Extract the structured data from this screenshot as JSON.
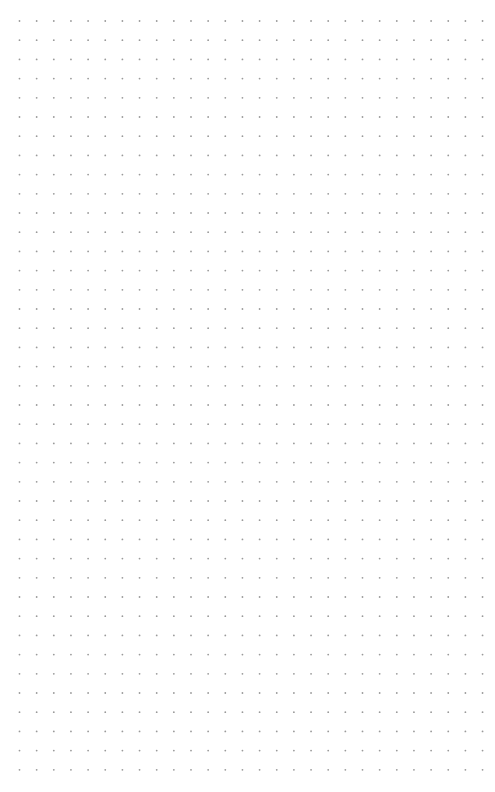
{
  "page": {
    "type": "dot-grid-paper",
    "background_color": "#ffffff",
    "dot_color": "#9a9a9a"
  },
  "grid": {
    "columns": 28,
    "rows": 40,
    "origin_x": 19.5,
    "origin_y": 21,
    "spacing_x": 17.15,
    "spacing_y": 19.2,
    "dot_radius": 0.9
  }
}
